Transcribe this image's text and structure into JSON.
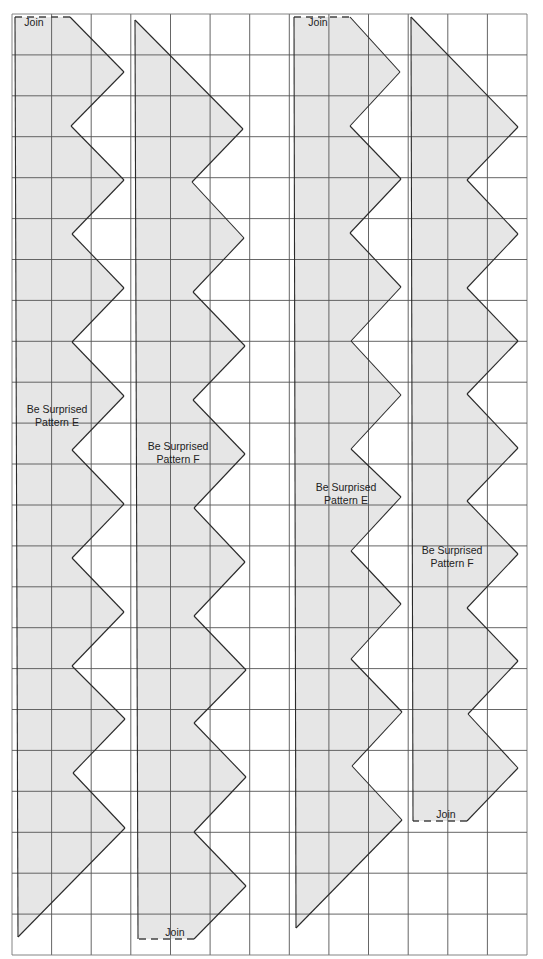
{
  "page": {
    "width": 543,
    "height": 959,
    "background": "#ffffff"
  },
  "grid": {
    "x0": 12,
    "y0": 14,
    "x1": 527,
    "y1": 955,
    "columns": 13,
    "rows": 23,
    "line_color": "#555555",
    "outer_color": "#777777"
  },
  "style": {
    "fill": "#e6e6e6",
    "outline": "#2a2a2a",
    "join_dash": "#444444"
  },
  "pieces": [
    {
      "id": "pattern-e-1",
      "label_lines": [
        "Be Surprised",
        "Pattern E"
      ],
      "label_pos": [
        57,
        413
      ],
      "join_label": "Join",
      "join_label_pos": [
        34,
        26
      ],
      "join_segment": [
        [
          15,
          17
        ],
        [
          70,
          17
        ]
      ],
      "points": [
        [
          15,
          17
        ],
        [
          70,
          17
        ],
        [
          124,
          72
        ],
        [
          71,
          126
        ],
        [
          124,
          180
        ],
        [
          72,
          234
        ],
        [
          124,
          288
        ],
        [
          72,
          342
        ],
        [
          124,
          396
        ],
        [
          72,
          450
        ],
        [
          124,
          504
        ],
        [
          72,
          558
        ],
        [
          124,
          612
        ],
        [
          72,
          666
        ],
        [
          125,
          719
        ],
        [
          73,
          773
        ],
        [
          125,
          828
        ],
        [
          18,
          937
        ]
      ]
    },
    {
      "id": "pattern-f-1",
      "label_lines": [
        "Be Surprised",
        "Pattern F"
      ],
      "label_pos": [
        178,
        450
      ],
      "join_label": "Join",
      "join_label_pos": [
        175,
        936
      ],
      "join_segment": [
        [
          138,
          939
        ],
        [
          194,
          939
        ]
      ],
      "points": [
        [
          135,
          20
        ],
        [
          243,
          129
        ],
        [
          192,
          182
        ],
        [
          244,
          238
        ],
        [
          193,
          292
        ],
        [
          245,
          346
        ],
        [
          193,
          400
        ],
        [
          245,
          454
        ],
        [
          194,
          508
        ],
        [
          245,
          562
        ],
        [
          194,
          616
        ],
        [
          246,
          670
        ],
        [
          194,
          723
        ],
        [
          246,
          777
        ],
        [
          194,
          832
        ],
        [
          246,
          886
        ],
        [
          194,
          939
        ],
        [
          138,
          939
        ]
      ]
    },
    {
      "id": "pattern-e-2",
      "label_lines": [
        "Be Surprised",
        "Pattern E"
      ],
      "label_pos": [
        346,
        491
      ],
      "join_label": "Join",
      "join_label_pos": [
        318,
        26
      ],
      "join_segment": [
        [
          294,
          17
        ],
        [
          350,
          17
        ]
      ],
      "points": [
        [
          294,
          17
        ],
        [
          350,
          17
        ],
        [
          400,
          72
        ],
        [
          350,
          126
        ],
        [
          401,
          179
        ],
        [
          350,
          233
        ],
        [
          401,
          287
        ],
        [
          351,
          341
        ],
        [
          401,
          395
        ],
        [
          351,
          449
        ],
        [
          401,
          497
        ],
        [
          351,
          551
        ],
        [
          401,
          604
        ],
        [
          351,
          659
        ],
        [
          402,
          712
        ],
        [
          352,
          766
        ],
        [
          402,
          820
        ],
        [
          296,
          928
        ]
      ]
    },
    {
      "id": "pattern-f-2",
      "label_lines": [
        "Be Surprised",
        "Pattern F"
      ],
      "label_pos": [
        452,
        554
      ],
      "join_label": "Join",
      "join_label_pos": [
        446,
        818
      ],
      "join_segment": [
        [
          413,
          821
        ],
        [
          467,
          821
        ]
      ],
      "points": [
        [
          411,
          17
        ],
        [
          518,
          127
        ],
        [
          467,
          180
        ],
        [
          518,
          234
        ],
        [
          467,
          288
        ],
        [
          518,
          341
        ],
        [
          467,
          394
        ],
        [
          518,
          448
        ],
        [
          467,
          501
        ],
        [
          518,
          554
        ],
        [
          467,
          608
        ],
        [
          518,
          661
        ],
        [
          468,
          714
        ],
        [
          518,
          768
        ],
        [
          467,
          821
        ],
        [
          413,
          821
        ]
      ]
    }
  ]
}
